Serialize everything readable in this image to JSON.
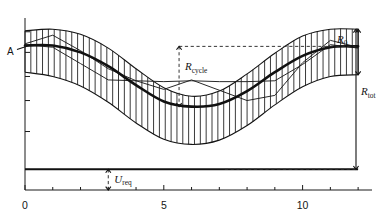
{
  "figure": {
    "title": "",
    "point_label_a": "A",
    "background_color": "#ffffff",
    "line_color": "#141414"
  },
  "annotations": {
    "r0": {
      "base": "R",
      "sub": "0"
    },
    "rcycle": {
      "base": "R",
      "sub": "cycle"
    },
    "rtot": {
      "base": "R",
      "sub": "tot"
    },
    "ureq": {
      "base": "U",
      "sub": "req"
    }
  },
  "chart_data": {
    "type": "line",
    "title": "",
    "xlabel": "",
    "ylabel": "",
    "xlim": [
      0,
      12.5
    ],
    "ylim": [
      0,
      10
    ],
    "grid": false,
    "legend": "none",
    "xticks": [
      0,
      1,
      2,
      3,
      4,
      5,
      6,
      7,
      8,
      9,
      10,
      11,
      12
    ],
    "xtick_labels": [
      "0",
      "",
      "",
      "",
      "",
      "5",
      "",
      "",
      "",
      "",
      "10",
      "",
      ""
    ],
    "yticks": [
      1.2,
      3.4,
      5.2,
      6.6,
      8.0,
      9.2
    ],
    "ytick_labels": [
      "",
      "",
      "",
      "",
      "",
      ""
    ],
    "series": [
      {
        "name": "upper band edge",
        "style": "solid-thin",
        "x": [
          0,
          1,
          2,
          3,
          4,
          5,
          6,
          7,
          8,
          9,
          10,
          11,
          12
        ],
        "y": [
          9.25,
          9.35,
          9.05,
          8.25,
          7.05,
          5.95,
          5.45,
          5.75,
          6.75,
          7.95,
          8.95,
          9.35,
          9.35
        ]
      },
      {
        "name": "lower band edge",
        "style": "solid-thin",
        "x": [
          0,
          1,
          2,
          3,
          4,
          5,
          6,
          7,
          8,
          9,
          10,
          11,
          12
        ],
        "y": [
          6.85,
          6.6,
          6.05,
          5.1,
          3.9,
          2.95,
          2.65,
          2.9,
          3.75,
          4.95,
          6.0,
          6.6,
          6.7
        ]
      },
      {
        "name": "mean curve (thick)",
        "style": "solid-thick",
        "x": [
          0,
          1,
          2,
          3,
          4,
          5,
          6,
          7,
          8,
          9,
          10,
          11,
          12
        ],
        "y": [
          8.4,
          8.4,
          8.0,
          7.2,
          6.1,
          5.15,
          4.85,
          5.0,
          5.75,
          6.85,
          7.8,
          8.3,
          8.35
        ]
      },
      {
        "name": "realisation zigzag 1",
        "style": "solid-thin-zigzag",
        "x": [
          0,
          1,
          2,
          3,
          4,
          5,
          6,
          7,
          8,
          9,
          10,
          11,
          12
        ],
        "y": [
          8.5,
          9.0,
          8.1,
          7.05,
          6.35,
          5.85,
          6.4,
          5.8,
          5.2,
          5.5,
          7.4,
          8.7,
          8.3
        ]
      },
      {
        "name": "realisation zigzag 2",
        "style": "solid-thin-zigzag",
        "x": [
          0,
          1,
          2,
          3,
          4,
          5,
          6,
          7,
          8,
          9,
          10,
          11,
          12
        ],
        "y": [
          8.45,
          8.3,
          7.35,
          6.4,
          6.35,
          6.3,
          6.35,
          6.3,
          6.3,
          6.35,
          7.3,
          8.45,
          8.25
        ]
      },
      {
        "name": "baseline u_req level",
        "style": "solid-heavy-horizontal",
        "x": [
          0,
          12
        ],
        "y": [
          1.2,
          1.2
        ]
      }
    ],
    "markers": [
      {
        "name": "A",
        "x": 0.15,
        "y": 8.4
      },
      {
        "name": "R0-top",
        "x": 12.0,
        "y": 9.35
      },
      {
        "name": "R0-bottom",
        "x": 12.0,
        "y": 6.7
      },
      {
        "name": "Rtot-bottom",
        "x": 12.0,
        "y": 1.2
      },
      {
        "name": "Rcycle-top",
        "x": 5.55,
        "y": 8.35
      },
      {
        "name": "Rcycle-bottom",
        "x": 5.55,
        "y": 4.85
      },
      {
        "name": "ureq-top",
        "x": 3.0,
        "y": 1.2
      },
      {
        "name": "ureq-bottom",
        "x": 3.0,
        "y": 0.0
      }
    ]
  }
}
